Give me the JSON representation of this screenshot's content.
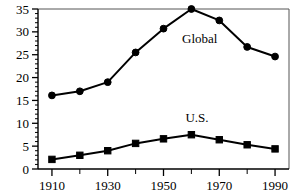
{
  "chart_data": {
    "type": "line",
    "title": "",
    "xlabel": "",
    "ylabel": "",
    "x": [
      1910,
      1920,
      1930,
      1940,
      1950,
      1960,
      1970,
      1980,
      1990
    ],
    "xlim": [
      1905,
      1995
    ],
    "ylim": [
      0,
      35
    ],
    "grid": false,
    "legend_position": "inline-annotation",
    "series": [
      {
        "name": "Global",
        "marker": "circle",
        "label_text": "Global",
        "label_x": 1963,
        "label_y": 27.5,
        "values": [
          16.1,
          17.0,
          19.0,
          25.5,
          30.7,
          35.0,
          32.5,
          26.7,
          24.6
        ]
      },
      {
        "name": "U.S.",
        "marker": "square",
        "label_text": "U.S.",
        "label_x": 1962,
        "label_y": 10.3,
        "values": [
          2.1,
          3.0,
          4.0,
          5.6,
          6.6,
          7.5,
          6.4,
          5.3,
          4.4
        ]
      }
    ],
    "y_ticks": [
      0,
      5,
      10,
      15,
      20,
      25,
      30,
      35
    ],
    "y_tick_labels": [
      "0",
      "5",
      "10",
      "15",
      "20",
      "25",
      "30",
      "35"
    ],
    "y_minor_tick_step": 1,
    "x_ticks": [
      1910,
      1920,
      1930,
      1940,
      1950,
      1960,
      1970,
      1980,
      1990
    ],
    "x_tick_labels": [
      "1910",
      "",
      "1930",
      "",
      "1950",
      "",
      "1970",
      "",
      "1990"
    ],
    "colors": {
      "line": "#000000",
      "marker": "#000000",
      "axis": "#000000",
      "frame": "#555555",
      "background": "#ffffff"
    }
  }
}
